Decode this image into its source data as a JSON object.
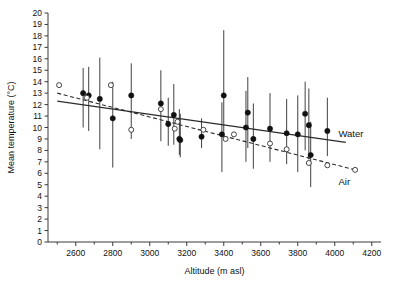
{
  "chart_data": {
    "type": "scatter",
    "title": "",
    "xlabel": "Altitude (m asl)",
    "ylabel": "Mean temperature (°C)",
    "xlim": [
      2450,
      4250
    ],
    "ylim": [
      0,
      20
    ],
    "grid": false,
    "legend_position": "in-plot-right",
    "x_ticks": [
      2600,
      2800,
      3000,
      3200,
      3400,
      3600,
      3800,
      4000,
      4200
    ],
    "x_tick_labels": [
      "2600",
      "2800",
      "3000",
      "3200",
      "3400",
      "3600",
      "3800",
      "4000",
      "4200"
    ],
    "x_minor_step": 100,
    "y_ticks": [
      0,
      1,
      2,
      3,
      4,
      5,
      6,
      7,
      8,
      9,
      10,
      11,
      12,
      13,
      14,
      15,
      16,
      17,
      18,
      19,
      20
    ],
    "y_tick_labels": [
      "0",
      "1",
      "2",
      "3",
      "4",
      "5",
      "6",
      "7",
      "8",
      "9",
      "10",
      "11",
      "12",
      "13",
      "14",
      "15",
      "16",
      "17",
      "18",
      "19",
      "20"
    ],
    "series": [
      {
        "name": "Water",
        "marker": "filled-circle",
        "line_style": "solid",
        "label": "Water",
        "label_x": 4020,
        "label_y": 9.2,
        "fit_line": {
          "x0": 2500,
          "y0": 12.3,
          "x1": 4060,
          "y1": 8.7
        },
        "points": [
          {
            "x": 2640,
            "y": 13.0,
            "lo": 10.0,
            "hi": 15.2
          },
          {
            "x": 2670,
            "y": 12.8,
            "lo": 9.7,
            "hi": 15.3
          },
          {
            "x": 2730,
            "y": 12.5,
            "lo": 8.1,
            "hi": 16.1
          },
          {
            "x": 2800,
            "y": 10.8,
            "lo": 6.5,
            "hi": 14.0
          },
          {
            "x": 2900,
            "y": 12.8,
            "lo": 9.0,
            "hi": 15.6
          },
          {
            "x": 3060,
            "y": 12.1,
            "lo": 8.8,
            "hi": 15.0
          },
          {
            "x": 3100,
            "y": 10.3,
            "lo": 8.4,
            "hi": 12.6
          },
          {
            "x": 3130,
            "y": 11.1,
            "lo": 8.5,
            "hi": 13.8
          },
          {
            "x": 3160,
            "y": 9.0,
            "lo": 7.6,
            "hi": 11.6
          },
          {
            "x": 3165,
            "y": 8.9,
            "lo": 7.4,
            "hi": 11.2
          },
          {
            "x": 3280,
            "y": 9.2,
            "lo": 8.2,
            "hi": 10.8
          },
          {
            "x": 3390,
            "y": 9.4,
            "lo": 6.1,
            "hi": 12.2
          },
          {
            "x": 3400,
            "y": 12.8,
            "lo": 9.2,
            "hi": 18.5
          },
          {
            "x": 3520,
            "y": 10.0,
            "lo": 7.0,
            "hi": 13.2
          },
          {
            "x": 3530,
            "y": 11.3,
            "lo": 8.2,
            "hi": 14.4
          },
          {
            "x": 3560,
            "y": 9.0,
            "lo": 6.4,
            "hi": 12.1
          },
          {
            "x": 3650,
            "y": 9.9,
            "lo": 7.0,
            "hi": 13.0
          },
          {
            "x": 3740,
            "y": 9.5,
            "lo": 6.8,
            "hi": 12.5
          },
          {
            "x": 3800,
            "y": 9.4,
            "lo": 6.1,
            "hi": 12.8
          },
          {
            "x": 3840,
            "y": 11.2,
            "lo": 8.0,
            "hi": 14.0
          },
          {
            "x": 3860,
            "y": 10.2,
            "lo": 7.2,
            "hi": 13.4
          },
          {
            "x": 3870,
            "y": 7.6,
            "lo": 4.8,
            "hi": 10.5
          },
          {
            "x": 3960,
            "y": 9.7,
            "lo": 7.5,
            "hi": 12.6
          }
        ]
      },
      {
        "name": "Air",
        "marker": "open-circle",
        "line_style": "dashed",
        "label": "Air",
        "label_x": 4020,
        "label_y": 5.0,
        "fit_line": {
          "x0": 2500,
          "y0": 13.0,
          "x1": 4110,
          "y1": 6.3
        },
        "points": [
          {
            "x": 2510,
            "y": 13.7
          },
          {
            "x": 2660,
            "y": 12.6
          },
          {
            "x": 2790,
            "y": 13.7
          },
          {
            "x": 2900,
            "y": 9.8
          },
          {
            "x": 3060,
            "y": 11.6
          },
          {
            "x": 3135,
            "y": 9.9
          },
          {
            "x": 3150,
            "y": 10.5
          },
          {
            "x": 3290,
            "y": 9.8
          },
          {
            "x": 3410,
            "y": 9.0
          },
          {
            "x": 3455,
            "y": 9.4
          },
          {
            "x": 3650,
            "y": 8.6
          },
          {
            "x": 3740,
            "y": 8.1
          },
          {
            "x": 3860,
            "y": 6.9
          },
          {
            "x": 3960,
            "y": 6.7
          },
          {
            "x": 4110,
            "y": 6.3
          }
        ]
      }
    ]
  }
}
